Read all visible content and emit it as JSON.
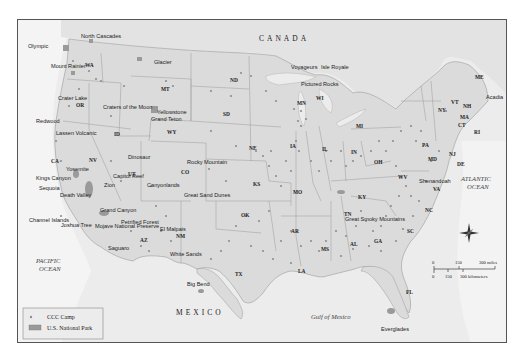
{
  "map": {
    "countries": {
      "canada": "CANADA",
      "mexico": "MEXICO"
    },
    "oceans": {
      "pacific": [
        "PACIFIC",
        "OCEAN"
      ],
      "atlantic": [
        "ATLANTIC",
        "OCEAN"
      ],
      "gulf": "Gulf of Mexico"
    },
    "states": [
      "WA",
      "OR",
      "CA",
      "NV",
      "ID",
      "MT",
      "WY",
      "UT",
      "CO",
      "AZ",
      "NM",
      "ND",
      "SD",
      "NE",
      "KS",
      "OK",
      "TX",
      "MN",
      "IA",
      "MO",
      "AR",
      "LA",
      "WI",
      "IL",
      "MI",
      "IN",
      "OH",
      "KY",
      "TN",
      "MS",
      "AL",
      "GA",
      "FL",
      "SC",
      "NC",
      "VA",
      "WV",
      "PA",
      "NY",
      "MD",
      "DE",
      "NJ",
      "CT",
      "RI",
      "MA",
      "VT",
      "NH",
      "ME"
    ],
    "national_parks": [
      "Olympic",
      "North Cascades",
      "Mount Rainier",
      "Crater Lake",
      "Redwood",
      "Lassen Volcanic",
      "Yosemite",
      "Kings Canyon",
      "Sequoia",
      "Death Valley",
      "Channel Islands",
      "Joshua Tree",
      "Mojave National Preserve",
      "Grand Canyon",
      "Petrified Forest",
      "Saguaro",
      "Zion",
      "Capitol Reef",
      "Canyonlands",
      "Dinosaur",
      "Craters of the Moon",
      "Glacier",
      "Yellowstone",
      "Grand Teton",
      "Rocky Mountain",
      "Great Sand Dunes",
      "El Malpais",
      "White Sands",
      "Big Bend",
      "Voyageurs",
      "Isle Royale",
      "Pictured Rocks",
      "Great Smoky Mountains",
      "Shenandoah",
      "Acadia",
      "Everglades"
    ],
    "legend": {
      "items": [
        {
          "symbol": "dot",
          "label": "CCC Camp"
        },
        {
          "symbol": "box",
          "label": "U.S. National Park"
        }
      ]
    },
    "scale": {
      "miles": [
        "0",
        "150",
        "300 miles"
      ],
      "kilometers": [
        "0",
        "150",
        "300 kilometers"
      ]
    },
    "compass": {
      "n": "N",
      "s": "S",
      "e": "E",
      "w": "W"
    },
    "colors": {
      "land": "#dcdcdc",
      "water": "#ebebeb",
      "camp_dot": "#8f8f8f",
      "park": "#9a9a9a",
      "border": "#8a8a8a"
    }
  }
}
